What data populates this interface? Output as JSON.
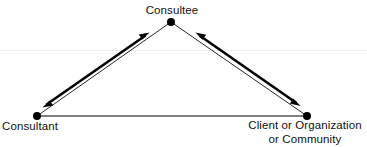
{
  "diagram": {
    "type": "triangle-relationship",
    "background_color": "#ffffff",
    "line_color": "#000000",
    "node_color": "#000000",
    "scanline_color": "#f0eeea",
    "nodes": [
      {
        "id": "consultee",
        "label": "Consultee",
        "x": 171,
        "y": 22,
        "label_position": "above"
      },
      {
        "id": "consultant",
        "label": "Consultant",
        "x": 37,
        "y": 116,
        "label_position": "below-left"
      },
      {
        "id": "client",
        "label_line1": "Client or Organization",
        "label_line2": "or Community",
        "label": "Client or Organization or Community",
        "x": 307,
        "y": 116,
        "label_position": "below-center"
      }
    ],
    "edges": [
      {
        "id": "edge-consultant-consultee",
        "from": "consultant",
        "to": "consultee",
        "style": "thin-line",
        "arrows": "none"
      },
      {
        "id": "edge-consultee-client",
        "from": "consultee",
        "to": "client",
        "style": "thin-line",
        "arrows": "none"
      },
      {
        "id": "edge-consultant-client",
        "from": "consultant",
        "to": "client",
        "style": "thin-line",
        "arrows": "none"
      }
    ],
    "arrows": [
      {
        "id": "arrow-left",
        "between": [
          "consultant",
          "consultee"
        ],
        "style": "thick-double-headed",
        "direction": "bidirectional"
      },
      {
        "id": "arrow-right",
        "between": [
          "consultee",
          "client"
        ],
        "style": "thick-double-headed",
        "direction": "bidirectional"
      }
    ]
  }
}
